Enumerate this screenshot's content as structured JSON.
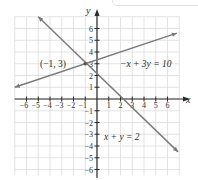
{
  "chart_data": {
    "type": "line",
    "title": "",
    "xlabel": "x",
    "ylabel": "y",
    "xlim": [
      -7,
      7
    ],
    "ylim": [
      -6.5,
      7
    ],
    "grid": true,
    "x_ticks": [
      -6,
      -5,
      -4,
      -3,
      -2,
      -1,
      1,
      2,
      3,
      4,
      5,
      6
    ],
    "y_ticks": [
      -6,
      -5,
      -4,
      -3,
      -2,
      -1,
      1,
      2,
      3,
      4,
      5,
      6
    ],
    "series": [
      {
        "name": "-x + 3y = 10",
        "label": "−x + 3y = 10",
        "equation": "-x + 3y = 10",
        "x": [
          -7,
          6.8
        ],
        "y": [
          1,
          5.6
        ],
        "arrows": "both"
      },
      {
        "name": "x + y = 2",
        "label": "x + y = 2",
        "equation": "x + y = 2",
        "x": [
          -5,
          6.9
        ],
        "y": [
          7,
          -4.5
        ],
        "arrows": "both"
      }
    ],
    "annotations": [
      {
        "text": "(−1, 3)",
        "x": -1,
        "y": 3,
        "type": "intersection-point"
      }
    ]
  },
  "style": {
    "line_color": "#7a7a7a",
    "axis_color": "#2a2a2a",
    "grid_color": "#dcdcdc",
    "text_color": "#2a2a2a"
  }
}
